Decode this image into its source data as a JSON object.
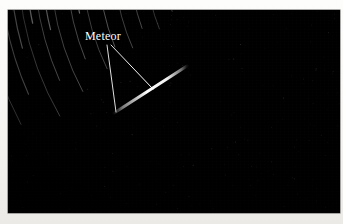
{
  "image": {
    "kind": "photograph",
    "subject": "long-exposure star trail photograph with a meteor",
    "background_color": "#000000",
    "paper_color": "#f6f4f1",
    "annotation_color": "#ffffff"
  },
  "annotations": [
    {
      "id": "meteor",
      "label": "Meteor",
      "label_x": 85,
      "label_y": 29,
      "leader_lines": [
        {
          "x1": 107,
          "y1": 45,
          "x2": 116,
          "y2": 112
        },
        {
          "x1": 111,
          "y1": 45,
          "x2": 153,
          "y2": 89
        }
      ]
    }
  ],
  "meteor_streak": {
    "x1": 114,
    "y1": 113,
    "x2": 187,
    "y2": 66,
    "peak_width": 3.0,
    "color": "#ffffff"
  },
  "star_trails": {
    "center_x": 330,
    "center_y": -40,
    "description": "concentric circular arcs centered on an off-frame celestial pole up and to the right",
    "arcs": [
      {
        "r": 70,
        "a0": 186,
        "a1": 250,
        "w": 0.7,
        "o": 0.3
      },
      {
        "r": 84,
        "a0": 182,
        "a1": 256,
        "w": 0.7,
        "o": 0.26
      },
      {
        "r": 96,
        "a0": 176,
        "a1": 252,
        "w": 0.8,
        "o": 0.34
      },
      {
        "r": 108,
        "a0": 170,
        "a1": 258,
        "w": 0.7,
        "o": 0.28
      },
      {
        "r": 118,
        "a0": 196,
        "a1": 246,
        "w": 0.9,
        "o": 0.42
      },
      {
        "r": 128,
        "a0": 168,
        "a1": 262,
        "w": 0.8,
        "o": 0.3
      },
      {
        "r": 138,
        "a0": 188,
        "a1": 240,
        "w": 0.8,
        "o": 0.36
      },
      {
        "r": 148,
        "a0": 164,
        "a1": 258,
        "w": 0.9,
        "o": 0.34
      },
      {
        "r": 158,
        "a0": 182,
        "a1": 244,
        "w": 1.0,
        "o": 0.48
      },
      {
        "r": 166,
        "a0": 162,
        "a1": 236,
        "w": 0.8,
        "o": 0.3
      },
      {
        "r": 176,
        "a0": 176,
        "a1": 252,
        "w": 1.0,
        "o": 0.44
      },
      {
        "r": 184,
        "a0": 158,
        "a1": 230,
        "w": 0.8,
        "o": 0.28
      },
      {
        "r": 192,
        "a0": 172,
        "a1": 248,
        "w": 1.1,
        "o": 0.55
      },
      {
        "r": 200,
        "a0": 160,
        "a1": 234,
        "w": 0.9,
        "o": 0.34
      },
      {
        "r": 208,
        "a0": 174,
        "a1": 252,
        "w": 1.2,
        "o": 0.62
      },
      {
        "r": 216,
        "a0": 156,
        "a1": 228,
        "w": 0.9,
        "o": 0.32
      },
      {
        "r": 224,
        "a0": 170,
        "a1": 246,
        "w": 1.1,
        "o": 0.52
      },
      {
        "r": 232,
        "a0": 158,
        "a1": 238,
        "w": 1.0,
        "o": 0.4
      },
      {
        "r": 240,
        "a0": 172,
        "a1": 250,
        "w": 1.2,
        "o": 0.66
      },
      {
        "r": 248,
        "a0": 154,
        "a1": 232,
        "w": 0.9,
        "o": 0.34
      },
      {
        "r": 256,
        "a0": 168,
        "a1": 244,
        "w": 1.2,
        "o": 0.58
      },
      {
        "r": 264,
        "a0": 158,
        "a1": 226,
        "w": 1.0,
        "o": 0.38
      },
      {
        "r": 272,
        "a0": 170,
        "a1": 248,
        "w": 1.3,
        "o": 0.7
      },
      {
        "r": 280,
        "a0": 152,
        "a1": 230,
        "w": 1.0,
        "o": 0.36
      },
      {
        "r": 288,
        "a0": 166,
        "a1": 242,
        "w": 1.2,
        "o": 0.56
      },
      {
        "r": 296,
        "a0": 156,
        "a1": 224,
        "w": 1.0,
        "o": 0.4
      },
      {
        "r": 304,
        "a0": 168,
        "a1": 246,
        "w": 1.3,
        "o": 0.64
      },
      {
        "r": 312,
        "a0": 150,
        "a1": 228,
        "w": 1.0,
        "o": 0.34
      },
      {
        "r": 320,
        "a0": 164,
        "a1": 240,
        "w": 1.2,
        "o": 0.52
      },
      {
        "r": 330,
        "a0": 156,
        "a1": 232,
        "w": 1.1,
        "o": 0.44
      },
      {
        "r": 340,
        "a0": 168,
        "a1": 244,
        "w": 1.2,
        "o": 0.5
      },
      {
        "r": 350,
        "a0": 152,
        "a1": 226,
        "w": 1.0,
        "o": 0.36
      },
      {
        "r": 60,
        "a0": 200,
        "a1": 242,
        "w": 0.6,
        "o": 0.22
      },
      {
        "r": 50,
        "a0": 196,
        "a1": 250,
        "w": 0.6,
        "o": 0.2
      },
      {
        "r": 40,
        "a0": 204,
        "a1": 246,
        "w": 0.6,
        "o": 0.18
      }
    ]
  }
}
